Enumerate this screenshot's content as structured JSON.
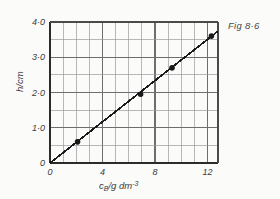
{
  "caption": "Fig 8·6",
  "chart_data": {
    "type": "scatter",
    "title": "",
    "subtitle": "",
    "xlabel": "c_B/g dm-3",
    "xlabel_parts": {
      "main": "c",
      "subscript": "B",
      "rest": "/g dm",
      "superscript": "-3"
    },
    "ylabel": "h/cm",
    "xlim": [
      0,
      12.8
    ],
    "ylim": [
      0,
      4.0
    ],
    "x_major_ticks": [
      0,
      4,
      8,
      12
    ],
    "x_major_tick_labels": [
      "0",
      "4",
      "8",
      "12"
    ],
    "x_minor_step": 1,
    "y_major_ticks": [
      0,
      1.0,
      2.0,
      3.0,
      4.0
    ],
    "y_major_tick_labels": [
      "0",
      "1·0",
      "2·0",
      "3·0",
      "4·0"
    ],
    "y_minor_step": 0.5,
    "grid": true,
    "legend": "none",
    "x": [
      2.1,
      6.9,
      9.3,
      12.3
    ],
    "values": [
      0.6,
      1.95,
      2.7,
      3.6
    ],
    "points": [
      {
        "x": 2.1,
        "y": 0.6
      },
      {
        "x": 6.9,
        "y": 1.95
      },
      {
        "x": 9.3,
        "y": 2.7
      },
      {
        "x": 12.3,
        "y": 3.6
      }
    ],
    "fit_line": {
      "type": "line",
      "through_origin": true,
      "slope": 0.292,
      "intercept": 0,
      "x_start": 0,
      "y_start": 0,
      "x_end": 12.8,
      "y_end": 3.74
    },
    "marker": "filled-circle",
    "line_color": "#1a1a1a",
    "grid_color": "#6e6e70",
    "minor_grid_color": "#9a9a9c"
  }
}
